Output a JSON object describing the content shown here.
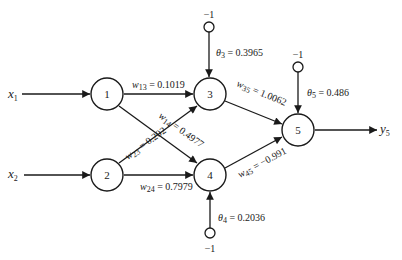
{
  "diagram": {
    "type": "neural-network",
    "inputs": [
      {
        "id": "x1",
        "label": "x",
        "sub": "1"
      },
      {
        "id": "x2",
        "label": "x",
        "sub": "2"
      }
    ],
    "output": {
      "id": "y5",
      "label": "y",
      "sub": "5"
    },
    "nodes": [
      {
        "id": "1",
        "label": "1"
      },
      {
        "id": "2",
        "label": "2"
      },
      {
        "id": "3",
        "label": "3"
      },
      {
        "id": "4",
        "label": "4"
      },
      {
        "id": "5",
        "label": "5"
      }
    ],
    "bias_inputs": {
      "n3": {
        "value": "−1",
        "theta_sym": "θ",
        "theta_sub": "3",
        "theta_val": " = 0.3965"
      },
      "n4": {
        "value": "−1",
        "theta_sym": "θ",
        "theta_sub": "4",
        "theta_val": " = 0.2036"
      },
      "n5": {
        "value": "−1",
        "theta_sym": "θ",
        "theta_sub": "5",
        "theta_val": " = 0.486"
      }
    },
    "weights": {
      "w13": {
        "sym": "w",
        "sub": "13",
        "val": " = 0.1019"
      },
      "w14": {
        "sym": "w",
        "sub": "14",
        "val": " = 0.4977"
      },
      "w23": {
        "sym": "w",
        "sub": "23",
        "val": " = 0.202"
      },
      "w24": {
        "sym": "w",
        "sub": "24",
        "val": " = 0.7979"
      },
      "w35": {
        "sym": "w",
        "sub": "35",
        "val": " = 1.0062"
      },
      "w45": {
        "sym": "w",
        "sub": "45",
        "val": " = −0.991"
      }
    }
  }
}
